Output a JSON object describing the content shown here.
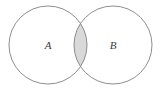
{
  "figure": {
    "kind": "venn-diagram",
    "background_color": "#ffffff",
    "width": 164,
    "height": 90
  },
  "sets": [
    {
      "id": "A",
      "label": "A",
      "label_x": 48,
      "label_y": 46,
      "circle": {
        "cx": 48,
        "cy": 45,
        "r": 39
      },
      "stroke_color": "#808080",
      "fill_color": "#ffffff"
    },
    {
      "id": "B",
      "label": "B",
      "label_x": 113,
      "label_y": 46,
      "circle": {
        "cx": 113,
        "cy": 45,
        "r": 39
      },
      "stroke_color": "#808080",
      "fill_color": "#ffffff"
    }
  ],
  "intersection": {
    "id": "A-and-B",
    "label": "",
    "fill_color": "#d9d9d9",
    "stroke_color": "#808080",
    "shaded": true,
    "top_point": {
      "x": 80.5,
      "y": 6.5
    },
    "bottom_point": {
      "x": 80.5,
      "y": 83.5
    }
  },
  "style": {
    "stroke_width": 0.9,
    "label_font_size": 11,
    "label_color": "#3a3a3a"
  }
}
